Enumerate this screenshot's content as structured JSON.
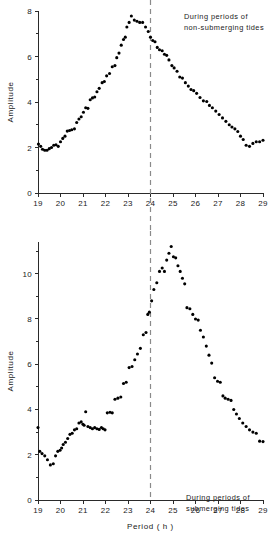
{
  "figure": {
    "background": "#ffffff",
    "dot_color": "#000000",
    "axis_color": "#2a2a2a",
    "divider_color": "#8a8a8a"
  },
  "panels": {
    "top": {
      "annotation_line1": "During periods of",
      "annotation_line2": "non-submerging tides",
      "ylabel": "Amplitude",
      "xlabel": "",
      "divider_label": "24"
    },
    "bottom": {
      "annotation_line1": "During periods of",
      "annotation_line2": "submerging tides",
      "ylabel": "Amplitude",
      "xlabel": "Period ( h )",
      "divider_label": "24"
    }
  },
  "chart_data": [
    {
      "type": "scatter",
      "title": "During periods of non-submerging tides",
      "xlabel": "",
      "ylabel": "Amplitude",
      "xlim": [
        19,
        29
      ],
      "ylim": [
        0,
        8
      ],
      "xticks": [
        19,
        20,
        21,
        22,
        23,
        24,
        25,
        26,
        27,
        28,
        29
      ],
      "xticklabels": [
        "19",
        "20",
        "21",
        "22",
        "23",
        "24",
        "25",
        "26",
        "27",
        "28",
        "29"
      ],
      "yticks": [
        0,
        2,
        4,
        6,
        8
      ],
      "yticklabels": [
        "0",
        "2",
        "4",
        "6",
        "8"
      ],
      "yminorticks": [
        1,
        3,
        5,
        7
      ],
      "grid": false,
      "legend": "none",
      "annotations": [
        {
          "text": "During periods of non-submerging tides",
          "x": 26.4,
          "y": 7.6
        }
      ],
      "vlines": [
        {
          "x": 24,
          "style": "dashed",
          "color": "#8a8a8a"
        }
      ],
      "x": [
        19.02,
        19.12,
        19.2,
        19.3,
        19.4,
        19.5,
        19.6,
        19.7,
        19.8,
        19.9,
        20.0,
        20.1,
        20.2,
        20.3,
        20.4,
        20.5,
        20.62,
        20.72,
        20.82,
        20.92,
        21.02,
        21.12,
        21.22,
        21.32,
        21.42,
        21.52,
        21.62,
        21.72,
        21.85,
        21.95,
        22.05,
        22.18,
        22.3,
        22.42,
        22.5,
        22.6,
        22.7,
        22.8,
        22.88,
        22.95,
        23.05,
        23.15,
        23.28,
        23.4,
        23.52,
        23.65,
        23.78,
        23.9,
        24.0,
        24.1,
        24.2,
        24.3,
        24.4,
        24.52,
        24.62,
        24.72,
        24.82,
        24.95,
        25.05,
        25.18,
        25.3,
        25.42,
        25.55,
        25.68,
        25.8,
        25.92,
        26.05,
        26.2,
        26.35,
        26.5,
        26.62,
        26.75,
        26.9,
        27.05,
        27.2,
        27.35,
        27.5,
        27.62,
        27.75,
        27.88,
        28.0,
        28.12,
        28.25,
        28.4,
        28.55,
        28.7,
        28.85,
        29.0
      ],
      "y": [
        2.15,
        2.05,
        1.92,
        1.88,
        1.88,
        1.95,
        2.0,
        2.1,
        2.12,
        2.05,
        2.25,
        2.4,
        2.5,
        2.72,
        2.75,
        2.78,
        2.82,
        3.1,
        3.25,
        3.35,
        3.55,
        3.75,
        3.72,
        4.1,
        4.18,
        4.22,
        4.45,
        4.6,
        4.85,
        4.9,
        5.15,
        5.25,
        5.55,
        5.6,
        5.95,
        6.15,
        6.5,
        6.75,
        6.85,
        7.3,
        7.5,
        7.78,
        7.6,
        7.55,
        7.5,
        7.5,
        7.3,
        7.1,
        6.85,
        6.7,
        6.65,
        6.4,
        6.3,
        6.25,
        6.1,
        6.05,
        5.85,
        5.6,
        5.5,
        5.35,
        5.1,
        5.05,
        4.85,
        4.7,
        4.55,
        4.5,
        4.38,
        4.2,
        4.05,
        4.02,
        3.85,
        3.75,
        3.6,
        3.45,
        3.3,
        3.15,
        3.0,
        2.9,
        2.82,
        2.7,
        2.5,
        2.35,
        2.1,
        2.05,
        2.18,
        2.25,
        2.25,
        2.32
      ]
    },
    {
      "type": "scatter",
      "title": "During periods of submerging tides",
      "xlabel": "Period ( h )",
      "ylabel": "Amplitude",
      "xlim": [
        19,
        29
      ],
      "ylim": [
        0,
        11.4
      ],
      "xticks": [
        19,
        20,
        21,
        22,
        23,
        24,
        25,
        26,
        27,
        28,
        29
      ],
      "xticklabels": [
        "19",
        "20",
        "21",
        "22",
        "23",
        "24",
        "25",
        "26",
        "27",
        "28",
        "29"
      ],
      "yticks": [
        0,
        2,
        4,
        6,
        8,
        10
      ],
      "yticklabels": [
        "0",
        "2",
        "4",
        "6",
        "8",
        "10"
      ],
      "yminorticks": [
        1,
        3,
        5,
        7,
        9,
        11
      ],
      "grid": false,
      "legend": "none",
      "annotations": [
        {
          "text": "During periods of submerging tides",
          "x": 26.3,
          "y": 10.2
        }
      ],
      "vlines": [
        {
          "x": 24,
          "style": "dashed",
          "color": "#8a8a8a"
        }
      ],
      "x": [
        19.0,
        19.08,
        19.18,
        19.3,
        19.42,
        19.55,
        19.68,
        19.78,
        19.88,
        19.98,
        20.05,
        20.12,
        20.22,
        20.32,
        20.42,
        20.52,
        20.62,
        20.72,
        20.82,
        20.92,
        21.0,
        21.05,
        21.12,
        21.22,
        21.32,
        21.42,
        21.52,
        21.62,
        21.72,
        21.82,
        21.9,
        21.98,
        22.08,
        22.2,
        22.3,
        22.42,
        22.55,
        22.68,
        22.8,
        22.92,
        23.05,
        23.18,
        23.3,
        23.42,
        23.55,
        23.68,
        23.8,
        23.88,
        23.95,
        24.05,
        24.15,
        24.28,
        24.4,
        24.52,
        24.62,
        24.72,
        24.82,
        24.92,
        25.02,
        25.12,
        25.22,
        25.32,
        25.42,
        25.52,
        25.62,
        25.75,
        25.88,
        26.0,
        26.12,
        26.22,
        26.35,
        26.48,
        26.6,
        26.72,
        26.85,
        26.98,
        27.1,
        27.22,
        27.32,
        27.45,
        27.58,
        27.7,
        27.82,
        27.95,
        28.1,
        28.25,
        28.4,
        28.55,
        28.7,
        28.85,
        29.0
      ],
      "y": [
        3.2,
        2.15,
        2.05,
        1.95,
        1.78,
        1.55,
        1.6,
        1.95,
        2.15,
        2.2,
        2.3,
        2.45,
        2.55,
        2.72,
        2.9,
        2.95,
        3.1,
        3.15,
        3.4,
        3.45,
        3.35,
        3.3,
        3.9,
        3.25,
        3.2,
        3.15,
        3.2,
        3.15,
        3.12,
        3.2,
        3.15,
        3.1,
        3.85,
        3.88,
        3.85,
        4.45,
        4.5,
        4.55,
        5.15,
        5.2,
        5.85,
        5.9,
        6.2,
        6.45,
        6.7,
        7.3,
        7.4,
        8.2,
        8.3,
        8.8,
        9.3,
        9.6,
        10.1,
        10.25,
        10.1,
        10.6,
        10.9,
        11.2,
        10.75,
        10.7,
        10.35,
        10.1,
        9.8,
        9.55,
        8.5,
        8.45,
        8.2,
        8.0,
        7.95,
        7.5,
        7.2,
        6.8,
        6.4,
        6.05,
        5.4,
        5.25,
        5.2,
        4.6,
        4.5,
        4.45,
        4.4,
        4.0,
        3.8,
        3.6,
        3.4,
        3.25,
        3.1,
        3.0,
        2.95,
        2.6,
        2.58
      ]
    }
  ]
}
